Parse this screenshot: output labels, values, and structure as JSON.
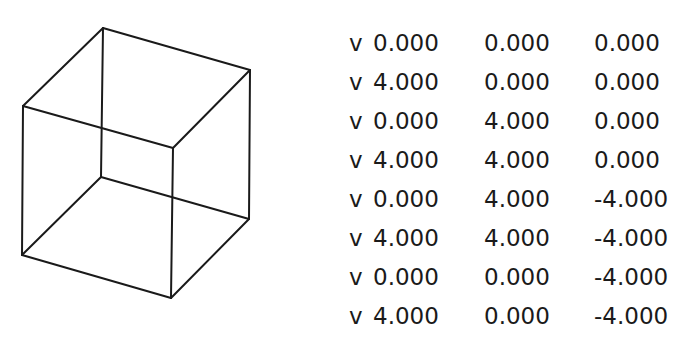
{
  "diagram": {
    "type": "wireframe-cube-with-obj-vertices",
    "cube": {
      "stroke_color": "#1a1a1a",
      "projected_vertices": [
        {
          "name": "back-top-left",
          "x": 103,
          "y": 28
        },
        {
          "name": "back-top-right",
          "x": 250,
          "y": 70
        },
        {
          "name": "front-top-left",
          "x": 23,
          "y": 106
        },
        {
          "name": "front-top-right",
          "x": 173,
          "y": 148
        },
        {
          "name": "back-bottom-left",
          "x": 101,
          "y": 177
        },
        {
          "name": "back-bottom-right",
          "x": 249,
          "y": 219
        },
        {
          "name": "front-bottom-left",
          "x": 22,
          "y": 255
        },
        {
          "name": "front-bottom-right",
          "x": 171,
          "y": 298
        }
      ]
    },
    "vertices": [
      {
        "prefix": "v",
        "x": "0.000",
        "y": "0.000",
        "z": "0.000"
      },
      {
        "prefix": "v",
        "x": "4.000",
        "y": "0.000",
        "z": "0.000"
      },
      {
        "prefix": "v",
        "x": "0.000",
        "y": "4.000",
        "z": "0.000"
      },
      {
        "prefix": "v",
        "x": "4.000",
        "y": "4.000",
        "z": "0.000"
      },
      {
        "prefix": "v",
        "x": "0.000",
        "y": "4.000",
        "z": "-4.000"
      },
      {
        "prefix": "v",
        "x": "4.000",
        "y": "4.000",
        "z": "-4.000"
      },
      {
        "prefix": "v",
        "x": "0.000",
        "y": "0.000",
        "z": "-4.000"
      },
      {
        "prefix": "v",
        "x": "4.000",
        "y": "0.000",
        "z": "-4.000"
      }
    ]
  }
}
